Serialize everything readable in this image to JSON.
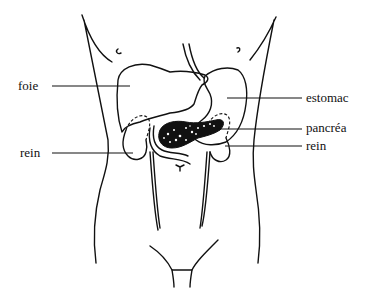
{
  "diagram": {
    "type": "anatomical-illustration",
    "labels": [
      {
        "id": "foie",
        "text": "foie",
        "side": "left"
      },
      {
        "id": "rein-left",
        "text": "rein",
        "side": "left"
      },
      {
        "id": "estomac",
        "text": "estomac",
        "side": "right"
      },
      {
        "id": "pancreas",
        "text": "pancréa",
        "side": "right"
      },
      {
        "id": "rein-right",
        "text": "rein",
        "side": "right"
      }
    ],
    "colors": {
      "line": "#111111",
      "background": "#ffffff"
    }
  }
}
